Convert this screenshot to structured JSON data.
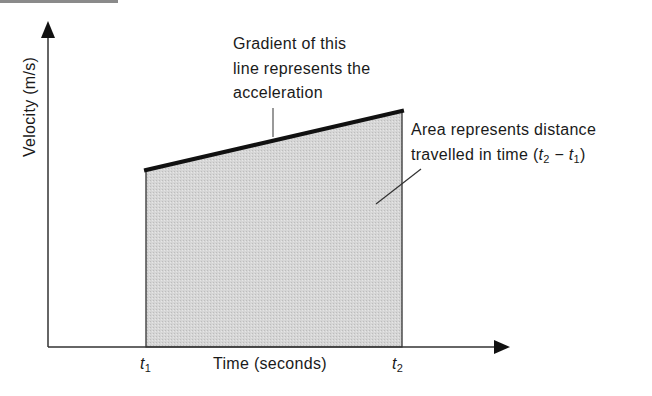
{
  "diagram": {
    "type": "velocity-time graph",
    "axes": {
      "y_label": "Velocity (m/s)",
      "x_label": "Time (seconds)",
      "x_ticks": [
        {
          "symbol": "t",
          "subscript": "1"
        },
        {
          "symbol": "t",
          "subscript": "2"
        }
      ]
    },
    "annotations": {
      "gradient": {
        "lines": [
          "Gradient of this",
          "line represents the",
          "acceleration"
        ]
      },
      "area": {
        "line1": "Area represents distance",
        "line2_prefix": "travelled in time (",
        "t2_symbol": "t",
        "t2_sub": "2",
        "minus": " − ",
        "t1_symbol": "t",
        "t1_sub": "1",
        "line2_suffix": ")"
      }
    },
    "colors": {
      "fill": "#d3d3d3",
      "line": "#111111",
      "axis": "#333333"
    },
    "geometry": {
      "origin": [
        48,
        347
      ],
      "y_axis_top": [
        48,
        22
      ],
      "x_axis_right": [
        509,
        347
      ],
      "region_top_left": [
        146,
        170
      ],
      "region_top_right": [
        402,
        111
      ],
      "region_bottom_left": [
        146,
        347
      ],
      "region_bottom_right": [
        402,
        347
      ]
    }
  }
}
